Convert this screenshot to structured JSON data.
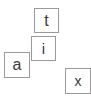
{
  "canvas": {
    "width": 91,
    "height": 96,
    "background_color": "#ffffff"
  },
  "style": {
    "tile_background": "#ffffff",
    "tile_border_color": "#9a9a9a",
    "glyph_color": "#3a3a3a"
  },
  "tiles": [
    {
      "id": "tile-t",
      "letter": "t",
      "x": 34,
      "y": 8,
      "width": 25,
      "height": 25
    },
    {
      "id": "tile-i",
      "letter": "i",
      "x": 31,
      "y": 36,
      "width": 25,
      "height": 25
    },
    {
      "id": "tile-a",
      "letter": "a",
      "x": 4,
      "y": 52,
      "width": 26,
      "height": 26
    },
    {
      "id": "tile-x",
      "letter": "x",
      "x": 65,
      "y": 68,
      "width": 26,
      "height": 26
    }
  ]
}
